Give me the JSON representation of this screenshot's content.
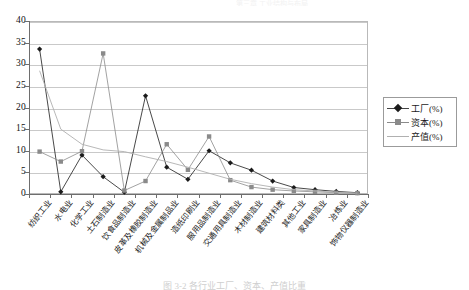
{
  "page": {
    "bleed_text": "第三章  工业结构与布局",
    "caption": "图 3-2   各行业工厂、资本、产值比重"
  },
  "legend": {
    "position": "right",
    "items": [
      {
        "label": "工厂(%)",
        "marker": "diamond",
        "color": "#1b1b1b"
      },
      {
        "label": "资本(%)",
        "marker": "square",
        "color": "#8a8a8a"
      },
      {
        "label": "产值(%)",
        "marker": "none",
        "color": "#b0b0b0"
      }
    ]
  },
  "chart_data": {
    "type": "line",
    "title": "",
    "subtitle": "",
    "xlabel": "",
    "ylabel": "",
    "ylim": [
      0,
      40
    ],
    "yticks": [
      0,
      5,
      10,
      15,
      20,
      25,
      30,
      35,
      40
    ],
    "grid": true,
    "legend_position": "right",
    "categories": [
      "纺织工业",
      "水电业",
      "化学工业",
      "土石制造业",
      "饮食品制造业",
      "皮革及橡胶制造业",
      "机械及金属制品业",
      "造纸印刷业",
      "服用品制造业",
      "交通用具制造业",
      "木材制造业",
      "建筑材料类",
      "其他工业",
      "家具制造业",
      "冶炼业",
      "饰物仪器制造业"
    ],
    "series": [
      {
        "name": "工厂(%)",
        "marker": "diamond",
        "color": "#1b1b1b",
        "values": [
          33.5,
          0.5,
          9.0,
          4.0,
          0.4,
          22.7,
          6.2,
          3.4,
          10.0,
          7.2,
          5.5,
          3.0,
          1.5,
          1.0,
          0.6,
          0.3
        ]
      },
      {
        "name": "资本(%)",
        "marker": "square",
        "color": "#8a8a8a",
        "values": [
          9.8,
          7.5,
          9.9,
          32.5,
          0.8,
          3.0,
          11.5,
          5.6,
          13.3,
          3.2,
          1.6,
          1.0,
          0.7,
          0.5,
          0.3,
          0.2
        ]
      },
      {
        "name": "产值(%)",
        "marker": "none",
        "color": "#b0b0b0",
        "values": [
          28.5,
          15.0,
          11.5,
          10.2,
          9.8,
          8.6,
          7.5,
          6.2,
          4.8,
          3.4,
          2.4,
          1.6,
          1.0,
          0.7,
          0.4,
          0.2
        ]
      }
    ]
  }
}
